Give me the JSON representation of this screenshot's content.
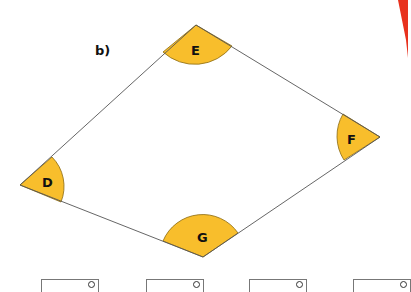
{
  "part_label": "b)",
  "shape": {
    "type": "quadrilateral",
    "vertices": [
      {
        "name": "E",
        "x": 196,
        "y": 25
      },
      {
        "name": "F",
        "x": 380,
        "y": 137
      },
      {
        "name": "G",
        "x": 203,
        "y": 257
      },
      {
        "name": "D",
        "x": 20,
        "y": 185
      }
    ],
    "line_color": "#555555",
    "angle_fill": "#F8BE2C",
    "angle_stroke": "#8a6a10"
  },
  "angle_labels": {
    "E": "E",
    "F": "F",
    "G": "G",
    "D": "D"
  },
  "answer_boxes": [
    {
      "unit": "°"
    },
    {
      "unit": "°"
    },
    {
      "unit": "°"
    },
    {
      "unit": "°"
    }
  ],
  "accent_color": "#E8321E"
}
